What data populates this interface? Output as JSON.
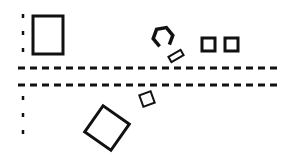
{
  "canvas": {
    "width": 294,
    "height": 157,
    "background": "#ffffff",
    "stroke": "#111111"
  },
  "lines": {
    "horizontal_upper": {
      "x1": 18,
      "x2": 278,
      "y": 68
    },
    "horizontal_lower": {
      "x1": 18,
      "x2": 278,
      "y": 85
    },
    "vertical_left_top": {
      "x": 23,
      "y1": 14,
      "y2": 54
    },
    "vertical_left_bottom": {
      "x": 23,
      "y1": 96,
      "y2": 134
    }
  },
  "shapes": [
    {
      "type": "rectangle",
      "name": "tall-rectangle",
      "x": 33,
      "y": 16,
      "w": 30,
      "h": 38,
      "rotate": 0
    },
    {
      "type": "hexagon",
      "name": "open-hexagon",
      "cx": 163,
      "cy": 37,
      "r": 10
    },
    {
      "type": "rectangle",
      "name": "small-tilted-bar",
      "cx": 176,
      "cy": 56,
      "w": 14,
      "h": 6,
      "rotate": -30
    },
    {
      "type": "square",
      "name": "small-square-1",
      "x": 202,
      "y": 38,
      "w": 13,
      "h": 13,
      "rotate": 0
    },
    {
      "type": "square",
      "name": "small-square-2",
      "x": 225,
      "y": 38,
      "w": 13,
      "h": 13,
      "rotate": 0
    },
    {
      "type": "square",
      "name": "small-tilted-square",
      "cx": 147,
      "cy": 99,
      "w": 12,
      "h": 12,
      "rotate": -20
    },
    {
      "type": "square",
      "name": "large-tilted-square",
      "cx": 107,
      "cy": 128,
      "w": 32,
      "h": 32,
      "rotate": 35
    }
  ]
}
